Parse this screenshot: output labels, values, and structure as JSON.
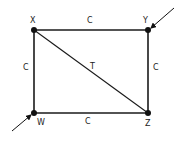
{
  "diagram": {
    "type": "truss-graph",
    "colors": {
      "line": "#1a1a1a",
      "node": "#111111",
      "text": "#222222",
      "background": "#ffffff"
    },
    "nodes": [
      {
        "id": "X",
        "label": "X",
        "x": 34,
        "y": 30
      },
      {
        "id": "Y",
        "label": "Y",
        "x": 148,
        "y": 30
      },
      {
        "id": "W",
        "label": "W",
        "x": 34,
        "y": 113
      },
      {
        "id": "Z",
        "label": "Z",
        "x": 148,
        "y": 113
      }
    ],
    "edges": [
      {
        "from": "X",
        "to": "Y",
        "label": "C"
      },
      {
        "from": "X",
        "to": "W",
        "label": "C"
      },
      {
        "from": "Y",
        "to": "Z",
        "label": "C"
      },
      {
        "from": "W",
        "to": "Z",
        "label": "C"
      },
      {
        "from": "X",
        "to": "Z",
        "label": "T"
      }
    ],
    "loads": [
      {
        "at": "Y",
        "direction": "from upper-right"
      },
      {
        "at": "W",
        "direction": "from lower-left"
      }
    ]
  },
  "labels": {
    "node_x": "X",
    "node_y": "Y",
    "node_w": "W",
    "node_z": "Z",
    "edge_xy": "C",
    "edge_xw": "C",
    "edge_yz": "C",
    "edge_wz": "C",
    "edge_xz": "T"
  }
}
